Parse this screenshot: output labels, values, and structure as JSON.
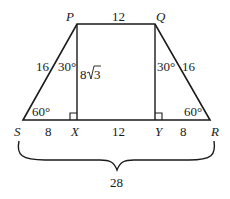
{
  "diagram": {
    "type": "isosceles-trapezoid",
    "colors": {
      "stroke": "#1a1a1a",
      "background": "#ffffff"
    },
    "vertices": {
      "P": {
        "label": "P"
      },
      "Q": {
        "label": "Q"
      },
      "R": {
        "label": "R"
      },
      "S": {
        "label": "S"
      },
      "X": {
        "label": "X"
      },
      "Y": {
        "label": "Y"
      }
    },
    "lengths": {
      "PQ": "12",
      "PS": "16",
      "QR": "16",
      "PX": "8",
      "PX_radical": "3",
      "SX": "8",
      "XY": "12",
      "YR": "8",
      "SR_total": "28"
    },
    "angles": {
      "SPX": "30°",
      "YQR": "30°",
      "PSX": "60°",
      "QRY": "60°"
    },
    "right_angles": [
      "X",
      "Y"
    ]
  }
}
